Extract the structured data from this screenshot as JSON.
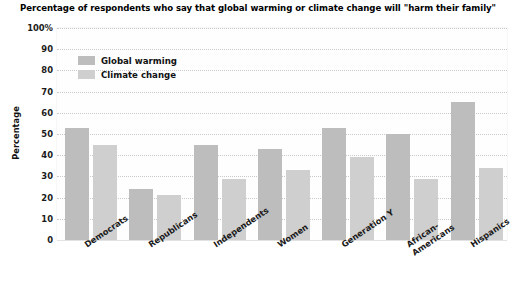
{
  "chart_data": {
    "type": "bar",
    "title": "Percentage of respondents who say that global warming or climate change will \"harm their family\"",
    "xlabel": "",
    "ylabel": "Percentage",
    "ylim": [
      0,
      100
    ],
    "ytick_step": 10,
    "ytick_labels": [
      "100%",
      "90",
      "80",
      "70",
      "60",
      "50",
      "40",
      "30",
      "20",
      "10",
      "0"
    ],
    "grid": true,
    "legend_position": "top-left",
    "categories": [
      "Democrats",
      "Republicans",
      "Independents",
      "Women",
      "Generation Y",
      "African-\nAmericans",
      "Hispanics"
    ],
    "series": [
      {
        "name": "Global warming",
        "color": "#bdbdbd",
        "values": [
          53,
          24,
          45,
          43,
          53,
          50,
          65
        ]
      },
      {
        "name": "Climate change",
        "color": "#cfcfcf",
        "values": [
          45,
          21,
          29,
          33,
          39,
          29,
          34
        ]
      }
    ]
  }
}
